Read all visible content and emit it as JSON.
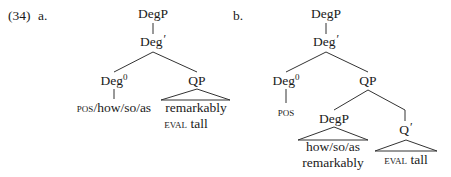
{
  "example": {
    "number": "(34)",
    "a_label": "a.",
    "b_label": "b."
  },
  "tree_a": {
    "root": "DegP",
    "bar": "Deg",
    "bar_prime": "′",
    "head": "Deg",
    "head_sup": "0",
    "head_terminal_sc": "pos",
    "head_terminal_rest": "/how/so/as",
    "complement": "QP",
    "complement_line1": "remarkably",
    "complement_line2_sc": "eval",
    "complement_line2_rest": " tall"
  },
  "tree_b": {
    "root": "DegP",
    "bar": "Deg",
    "bar_prime": "′",
    "head": "Deg",
    "head_sup": "0",
    "head_terminal_sc": "pos",
    "complement": "QP",
    "spec": "DegP",
    "spec_line1": "how/so/as",
    "spec_line2": "remarkably",
    "qbar": "Q",
    "qbar_prime": "′",
    "qbar_line1_sc": "eval",
    "qbar_line1_rest": " tall"
  }
}
